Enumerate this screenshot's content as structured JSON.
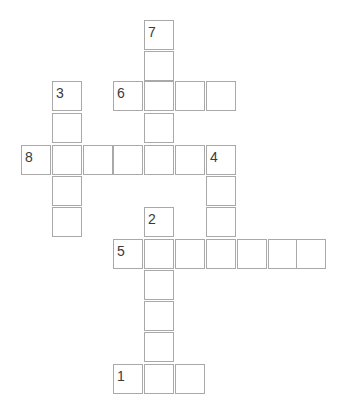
{
  "puzzle": {
    "type": "crossword",
    "rows": 12,
    "cols": 10,
    "cell_border_color": "#a9a9a9",
    "number_color": "#3a3a3a",
    "col_x": [
      21,
      52,
      83,
      113,
      144,
      175,
      206,
      237,
      268,
      296
    ],
    "row_y": [
      20,
      51,
      81,
      113,
      145,
      176,
      207,
      239,
      270,
      301,
      332,
      364
    ],
    "cells": [
      {
        "r": 0,
        "c": 4,
        "num": "7",
        "value": ""
      },
      {
        "r": 1,
        "c": 4,
        "num": "",
        "value": ""
      },
      {
        "r": 2,
        "c": 1,
        "num": "3",
        "value": ""
      },
      {
        "r": 2,
        "c": 3,
        "num": "6",
        "value": ""
      },
      {
        "r": 2,
        "c": 4,
        "num": "",
        "value": ""
      },
      {
        "r": 2,
        "c": 5,
        "num": "",
        "value": ""
      },
      {
        "r": 2,
        "c": 6,
        "num": "",
        "value": ""
      },
      {
        "r": 3,
        "c": 1,
        "num": "",
        "value": ""
      },
      {
        "r": 3,
        "c": 4,
        "num": "",
        "value": ""
      },
      {
        "r": 4,
        "c": 0,
        "num": "8",
        "value": ""
      },
      {
        "r": 4,
        "c": 1,
        "num": "",
        "value": ""
      },
      {
        "r": 4,
        "c": 2,
        "num": "",
        "value": ""
      },
      {
        "r": 4,
        "c": 3,
        "num": "",
        "value": ""
      },
      {
        "r": 4,
        "c": 4,
        "num": "",
        "value": ""
      },
      {
        "r": 4,
        "c": 5,
        "num": "",
        "value": ""
      },
      {
        "r": 4,
        "c": 6,
        "num": "4",
        "value": ""
      },
      {
        "r": 5,
        "c": 1,
        "num": "",
        "value": ""
      },
      {
        "r": 5,
        "c": 6,
        "num": "",
        "value": ""
      },
      {
        "r": 6,
        "c": 1,
        "num": "",
        "value": ""
      },
      {
        "r": 6,
        "c": 4,
        "num": "2",
        "value": ""
      },
      {
        "r": 6,
        "c": 6,
        "num": "",
        "value": ""
      },
      {
        "r": 7,
        "c": 3,
        "num": "5",
        "value": ""
      },
      {
        "r": 7,
        "c": 4,
        "num": "",
        "value": ""
      },
      {
        "r": 7,
        "c": 5,
        "num": "",
        "value": ""
      },
      {
        "r": 7,
        "c": 6,
        "num": "",
        "value": ""
      },
      {
        "r": 7,
        "c": 7,
        "num": "",
        "value": ""
      },
      {
        "r": 7,
        "c": 8,
        "num": "",
        "value": ""
      },
      {
        "r": 7,
        "c": 9,
        "num": "",
        "value": ""
      },
      {
        "r": 8,
        "c": 4,
        "num": "",
        "value": ""
      },
      {
        "r": 9,
        "c": 4,
        "num": "",
        "value": ""
      },
      {
        "r": 10,
        "c": 4,
        "num": "",
        "value": ""
      },
      {
        "r": 11,
        "c": 3,
        "num": "1",
        "value": ""
      },
      {
        "r": 11,
        "c": 4,
        "num": "",
        "value": ""
      },
      {
        "r": 11,
        "c": 5,
        "num": "",
        "value": ""
      }
    ],
    "words": [
      {
        "num": "1",
        "direction": "across",
        "length": 3
      },
      {
        "num": "2",
        "direction": "down",
        "length": 6
      },
      {
        "num": "3",
        "direction": "down",
        "length": 5
      },
      {
        "num": "4",
        "direction": "down",
        "length": 4
      },
      {
        "num": "5",
        "direction": "across",
        "length": 7
      },
      {
        "num": "6",
        "direction": "across",
        "length": 4
      },
      {
        "num": "7",
        "direction": "down",
        "length": 4
      },
      {
        "num": "8",
        "direction": "across",
        "length": 7
      }
    ]
  }
}
